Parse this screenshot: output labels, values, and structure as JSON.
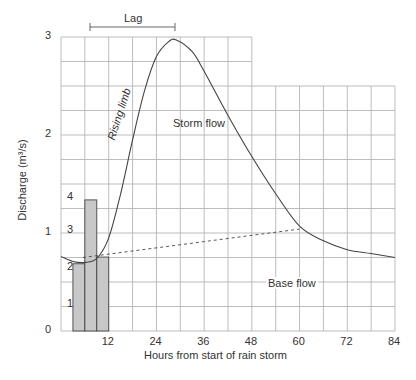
{
  "chart_data": {
    "type": "line",
    "title": "",
    "xlabel": "Hours from start of rain storm",
    "ylabel": "Discharge (m³/s)",
    "xlim": [
      0,
      84
    ],
    "ylim": [
      0,
      3
    ],
    "x_ticks": [
      "12",
      "24",
      "36",
      "48",
      "60",
      "72",
      "84"
    ],
    "y_ticks": [
      "0",
      "1",
      "2",
      "3"
    ],
    "grid": true,
    "series": [
      {
        "name": "Hydrograph discharge",
        "x": [
          0,
          3,
          6,
          9,
          12,
          15,
          18,
          21,
          24,
          27,
          29,
          33,
          36,
          42,
          48,
          54,
          60,
          66,
          72,
          78,
          84
        ],
        "values": [
          0.76,
          0.71,
          0.7,
          0.74,
          0.95,
          1.4,
          1.95,
          2.45,
          2.8,
          2.95,
          2.97,
          2.85,
          2.65,
          2.2,
          1.78,
          1.4,
          1.07,
          0.92,
          0.83,
          0.79,
          0.75
        ]
      },
      {
        "name": "Base flow separation (dashed)",
        "x": [
          5.5,
          60
        ],
        "values": [
          0.75,
          1.04
        ]
      }
    ],
    "rainfall_bars": {
      "y2_ticks": [
        "1",
        "2",
        "3",
        "4"
      ],
      "bars": [
        {
          "x_start": 3,
          "x_end": 6,
          "value": 2.0
        },
        {
          "x_start": 6,
          "x_end": 9,
          "value": 3.9
        },
        {
          "x_start": 9,
          "x_end": 12,
          "value": 2.2
        }
      ]
    },
    "annotations": [
      "Lag",
      "Rising limb",
      "Storm flow",
      "Base flow"
    ]
  },
  "labels": {
    "lag": "Lag",
    "rising_limb": "Rising limb",
    "storm_flow": "Storm flow",
    "base_flow": "Base flow",
    "xlabel": "Hours from start of rain storm",
    "ylabel": "Discharge (m³/s)"
  }
}
